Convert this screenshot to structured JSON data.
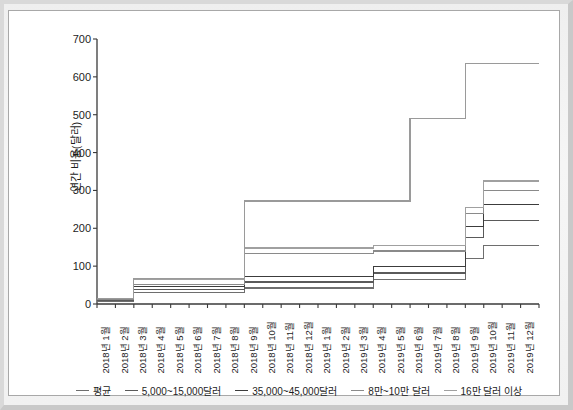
{
  "chart_data": {
    "type": "line",
    "subtype": "step",
    "title": "",
    "xlabel": "",
    "ylabel": "연간 비용(달러)",
    "ylim": [
      0,
      700
    ],
    "yticks": [
      0,
      100,
      200,
      300,
      400,
      500,
      600,
      700
    ],
    "ytick_labels": [
      "0",
      "100",
      "200",
      "300",
      "400",
      "500",
      "600",
      "700"
    ],
    "grid": false,
    "legend_position": "bottom",
    "categories": [
      "2018년 1월",
      "2018년 2월",
      "2018년 3월",
      "2018년 4월",
      "2018년 5월",
      "2018년 6월",
      "2018년 7월",
      "2018년 8월",
      "2018년 9월",
      "2018년 10월",
      "2018년 11월",
      "2018년 12월",
      "2019년 1월",
      "2019년 2월",
      "2019년 3월",
      "2019년 4월",
      "2019년 5월",
      "2019년 6월",
      "2019년 7월",
      "2019년 8월",
      "2019년 9월",
      "2019년 10월",
      "2019년 11월",
      "2019년 12월"
    ],
    "series": [
      {
        "name": "평균",
        "color": "#6e6e6e",
        "values": [
          8,
          8,
          30,
          30,
          30,
          30,
          30,
          30,
          42,
          42,
          42,
          42,
          42,
          42,
          42,
          65,
          65,
          65,
          65,
          65,
          120,
          155,
          155,
          155
        ]
      },
      {
        "name": "5,000~15,000달러",
        "color": "#5a5a5a",
        "values": [
          10,
          10,
          38,
          38,
          38,
          38,
          38,
          38,
          58,
          58,
          58,
          58,
          58,
          58,
          58,
          82,
          82,
          82,
          82,
          82,
          175,
          220,
          220,
          220
        ]
      },
      {
        "name": "35,000~45,000달러",
        "color": "#3c3c3c",
        "values": [
          12,
          12,
          46,
          46,
          46,
          46,
          46,
          46,
          72,
          72,
          72,
          72,
          72,
          72,
          72,
          100,
          100,
          100,
          100,
          100,
          205,
          262,
          262,
          262
        ]
      },
      {
        "name": "8만~10만 달러",
        "color": "#8a8a8a",
        "values": [
          13,
          13,
          52,
          52,
          52,
          52,
          52,
          52,
          134,
          134,
          134,
          134,
          134,
          134,
          134,
          140,
          140,
          140,
          140,
          140,
          240,
          300,
          300,
          300
        ]
      },
      {
        "name": "16만 달러 이상",
        "color": "#a0a0a0",
        "values": [
          14,
          14,
          65,
          65,
          65,
          65,
          65,
          65,
          148,
          148,
          148,
          148,
          148,
          148,
          148,
          155,
          155,
          155,
          155,
          155,
          255,
          325,
          325,
          325
        ]
      },
      {
        "name": "상단 누적",
        "color": "#9a9a9a",
        "values": [
          15,
          15,
          68,
          68,
          68,
          68,
          68,
          68,
          272,
          272,
          272,
          272,
          272,
          272,
          272,
          272,
          272,
          490,
          490,
          490,
          635,
          635,
          635,
          635
        ]
      }
    ]
  },
  "legend": {
    "items": [
      {
        "label": "평균",
        "color": "#6e6e6e"
      },
      {
        "label": "5,000~15,000달러",
        "color": "#5a5a5a"
      },
      {
        "label": "35,000~45,000달러",
        "color": "#3c3c3c"
      },
      {
        "label": "8만~10만 달러",
        "color": "#8a8a8a"
      },
      {
        "label": "16만 달러 이상",
        "color": "#a0a0a0"
      }
    ]
  },
  "axis": {
    "y_title": "연간 비용(달러)"
  }
}
